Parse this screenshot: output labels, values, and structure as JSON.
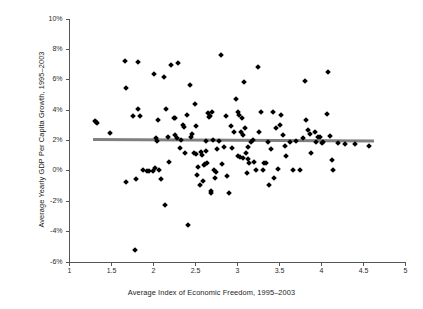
{
  "chart_data": {
    "type": "scatter",
    "title": "",
    "xlabel": "Average Index of Economic Freedom, 1995–2003",
    "ylabel": "Average Yearly GDP Per Capita Growth, 1995–2003",
    "xlim": [
      1,
      5
    ],
    "ylim": [
      -6,
      10
    ],
    "xticks": [
      1,
      1.5,
      2,
      2.5,
      3,
      3.5,
      4,
      4.5,
      5
    ],
    "xtick_labels": [
      "1",
      "1.5",
      "2",
      "2.5",
      "3",
      "3.5",
      "4",
      "4.5",
      "5"
    ],
    "yticks": [
      -6,
      -4,
      -2,
      0,
      2,
      4,
      6,
      8,
      10
    ],
    "ytick_labels": [
      "-6%",
      "-4%",
      "-2%",
      "0%",
      "2%",
      "4%",
      "6%",
      "8%",
      "10%"
    ],
    "grid": false,
    "legend": null,
    "marker": "diamond",
    "marker_color": "#000000",
    "trendline": {
      "color": "#808080",
      "x_start": 1.28,
      "x_end": 4.62,
      "y_start": 2.05,
      "y_end": 1.95,
      "slope": -0.03,
      "intercept": 2.09
    },
    "points": [
      [
        1.3,
        3.3
      ],
      [
        1.31,
        3.22
      ],
      [
        1.33,
        3.15
      ],
      [
        1.48,
        2.5
      ],
      [
        1.66,
        7.25
      ],
      [
        1.67,
        5.45
      ],
      [
        1.67,
        -0.7
      ],
      [
        1.76,
        3.6
      ],
      [
        1.78,
        -5.2
      ],
      [
        1.79,
        -0.55
      ],
      [
        1.81,
        7.2
      ],
      [
        1.82,
        4.1
      ],
      [
        1.84,
        3.62
      ],
      [
        1.88,
        0.05
      ],
      [
        1.92,
        0.02
      ],
      [
        1.95,
        0.0
      ],
      [
        1.99,
        0.0
      ],
      [
        2.0,
        6.35
      ],
      [
        2.02,
        0.2
      ],
      [
        2.03,
        2.15
      ],
      [
        2.04,
        1.95
      ],
      [
        2.05,
        3.35
      ],
      [
        2.07,
        0.05
      ],
      [
        2.09,
        -0.55
      ],
      [
        2.12,
        6.15
      ],
      [
        2.14,
        -2.25
      ],
      [
        2.15,
        4.1
      ],
      [
        2.17,
        2.2
      ],
      [
        2.19,
        0.6
      ],
      [
        2.21,
        7.0
      ],
      [
        2.24,
        3.5
      ],
      [
        2.25,
        3.48
      ],
      [
        2.26,
        2.35
      ],
      [
        2.28,
        2.15
      ],
      [
        2.29,
        7.1
      ],
      [
        2.31,
        1.5
      ],
      [
        2.33,
        2.05
      ],
      [
        2.35,
        3.0
      ],
      [
        2.36,
        2.9
      ],
      [
        2.38,
        1.2
      ],
      [
        2.4,
        3.7
      ],
      [
        2.41,
        -3.55
      ],
      [
        2.43,
        5.65
      ],
      [
        2.45,
        2.2
      ],
      [
        2.46,
        2.45
      ],
      [
        2.48,
        1.15
      ],
      [
        2.49,
        4.4
      ],
      [
        2.5,
        2.95
      ],
      [
        2.51,
        1.1
      ],
      [
        2.52,
        -0.3
      ],
      [
        2.53,
        0.25
      ],
      [
        2.55,
        -0.9
      ],
      [
        2.57,
        1.25
      ],
      [
        2.58,
        1.05
      ],
      [
        2.59,
        -0.65
      ],
      [
        2.6,
        0.4
      ],
      [
        2.61,
        0.45
      ],
      [
        2.62,
        2.0
      ],
      [
        2.63,
        1.3
      ],
      [
        2.64,
        0.5
      ],
      [
        2.65,
        3.8
      ],
      [
        2.66,
        3.55
      ],
      [
        2.67,
        3.6
      ],
      [
        2.68,
        -1.3
      ],
      [
        2.69,
        -1.45
      ],
      [
        2.7,
        3.85
      ],
      [
        2.71,
        2.05
      ],
      [
        2.72,
        0.05
      ],
      [
        2.73,
        -0.5
      ],
      [
        2.74,
        -0.05
      ],
      [
        2.76,
        1.45
      ],
      [
        2.78,
        2.0
      ],
      [
        2.8,
        7.6
      ],
      [
        2.82,
        0.45
      ],
      [
        2.84,
        1.6
      ],
      [
        2.86,
        3.6
      ],
      [
        2.88,
        -0.35
      ],
      [
        2.9,
        -1.45
      ],
      [
        2.92,
        2.95
      ],
      [
        2.94,
        1.5
      ],
      [
        2.96,
        2.55
      ],
      [
        2.98,
        4.7
      ],
      [
        3.0,
        1.0
      ],
      [
        3.01,
        3.9
      ],
      [
        3.02,
        3.7
      ],
      [
        3.03,
        0.9
      ],
      [
        3.04,
        2.55
      ],
      [
        3.05,
        3.45
      ],
      [
        3.06,
        2.35
      ],
      [
        3.07,
        0.85
      ],
      [
        3.08,
        5.85
      ],
      [
        3.09,
        2.8
      ],
      [
        3.1,
        1.15
      ],
      [
        3.11,
        -0.15
      ],
      [
        3.12,
        1.6
      ],
      [
        3.13,
        0.75
      ],
      [
        3.14,
        0.55
      ],
      [
        3.16,
        1.9
      ],
      [
        3.18,
        2.05
      ],
      [
        3.2,
        0.6
      ],
      [
        3.22,
        0.05
      ],
      [
        3.24,
        6.85
      ],
      [
        3.26,
        2.55
      ],
      [
        3.28,
        3.9
      ],
      [
        3.3,
        0.05
      ],
      [
        3.32,
        0.55
      ],
      [
        3.34,
        0.5
      ],
      [
        3.36,
        1.9
      ],
      [
        3.38,
        -0.9
      ],
      [
        3.4,
        1.45
      ],
      [
        3.42,
        3.85
      ],
      [
        3.44,
        -0.5
      ],
      [
        3.46,
        2.8
      ],
      [
        3.48,
        0.1
      ],
      [
        3.5,
        3.05
      ],
      [
        3.52,
        3.65
      ],
      [
        3.54,
        2.35
      ],
      [
        3.56,
        1.65
      ],
      [
        3.58,
        0.95
      ],
      [
        3.62,
        1.9
      ],
      [
        3.66,
        0.05
      ],
      [
        3.7,
        2.0
      ],
      [
        3.74,
        0.05
      ],
      [
        3.78,
        2.15
      ],
      [
        3.8,
        5.95
      ],
      [
        3.82,
        3.35
      ],
      [
        3.84,
        2.7
      ],
      [
        3.86,
        2.4
      ],
      [
        3.88,
        1.15
      ],
      [
        3.92,
        2.55
      ],
      [
        3.94,
        1.9
      ],
      [
        3.96,
        2.25
      ],
      [
        3.98,
        2.2
      ],
      [
        4.0,
        1.85
      ],
      [
        4.02,
        1.9
      ],
      [
        4.06,
        3.75
      ],
      [
        4.08,
        6.5
      ],
      [
        4.1,
        2.3
      ],
      [
        4.12,
        0.7
      ],
      [
        4.14,
        0.05
      ],
      [
        4.2,
        1.85
      ],
      [
        4.28,
        1.8
      ],
      [
        4.4,
        1.75
      ],
      [
        4.56,
        1.65
      ]
    ]
  },
  "axes": {
    "y_axis_name": "vertical-axis",
    "x_axis_name": "horizontal-axis"
  }
}
